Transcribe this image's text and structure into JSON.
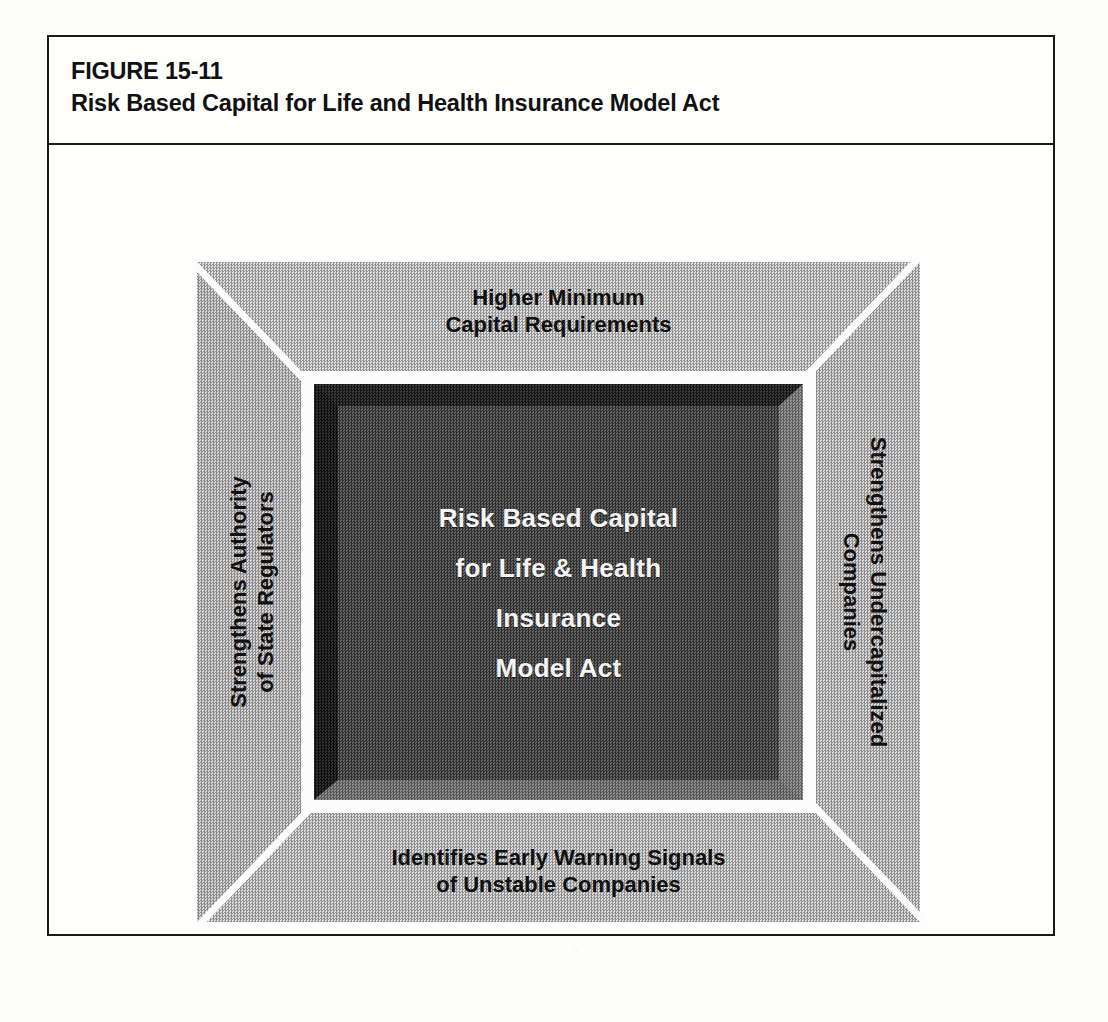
{
  "figure": {
    "number": "FIGURE 15-11",
    "caption": "Risk Based Capital for Life and Health Insurance Model Act"
  },
  "diagram": {
    "type": "framed-concept-box",
    "center": {
      "lines": [
        "Risk Based Capital",
        "for Life & Health",
        "Insurance",
        "Model Act"
      ]
    },
    "panels": {
      "top": {
        "position": "top",
        "lines": [
          "Higher Minimum",
          "Capital Requirements"
        ]
      },
      "right": {
        "position": "right",
        "rotation": "90",
        "lines": [
          "Strengthens Undercapitalized",
          "Companies"
        ]
      },
      "bottom": {
        "position": "bottom",
        "lines": [
          "Identifies Early Warning Signals",
          "of Unstable Companies"
        ]
      },
      "left": {
        "position": "left",
        "rotation": "-90",
        "lines": [
          "Strengthens Authority",
          "of State Regulators"
        ]
      }
    }
  },
  "colors": {
    "page_background": "#fdfdfc",
    "border": "#1a1a1a",
    "frame_gray": "#b9b9b9",
    "well_dark": "#3b3b3b",
    "well_text": "#f4f4f4",
    "label_text": "#111111"
  }
}
